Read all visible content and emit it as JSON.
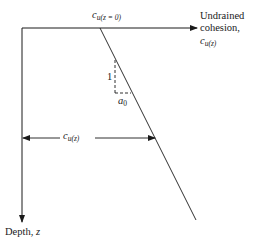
{
  "diagram": {
    "x_axis": {
      "label_line1": "Undrained",
      "label_line2": "cohesion,",
      "symbol": "c",
      "symbol_sub": "u(z)"
    },
    "y_axis": {
      "label": "Depth, ",
      "symbol": "z"
    },
    "surface_value": {
      "symbol": "c",
      "symbol_sub": "u(z = 0)"
    },
    "slope": {
      "rise_label": "1",
      "run_symbol": "a",
      "run_sub": "0"
    },
    "depth_value": {
      "symbol": "c",
      "symbol_sub": "u(z)"
    }
  }
}
